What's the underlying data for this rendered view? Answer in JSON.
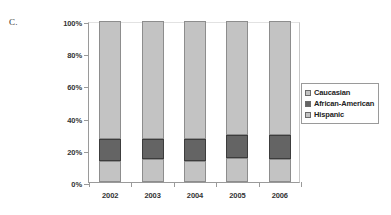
{
  "panel": {
    "letter": "C."
  },
  "legend": {
    "position": "right",
    "entries": [
      {
        "label": "Caucasian",
        "color": "#c3c3c3"
      },
      {
        "label": "African-American",
        "color": "#646464"
      },
      {
        "label": "Hispanic",
        "color": "#c3c3c3"
      }
    ]
  },
  "axes": {
    "y_ticks": [
      "0%",
      "20%",
      "40%",
      "60%",
      "80%",
      "100%"
    ],
    "x_ticks": [
      "2002",
      "2003",
      "2004",
      "2005",
      "2006"
    ]
  },
  "chart_data": {
    "type": "bar",
    "title": "",
    "subtitle": "",
    "xlabel": "",
    "ylabel": "",
    "stacked": true,
    "stack_total": 100,
    "grid": false,
    "legend_position": "right",
    "ylim": [
      0,
      100
    ],
    "ytick_values": [
      0,
      20,
      40,
      60,
      80,
      100
    ],
    "ytick_labels": [
      "0%",
      "20%",
      "40%",
      "60%",
      "80%",
      "100%"
    ],
    "categories": [
      "2002",
      "2003",
      "2004",
      "2005",
      "2006"
    ],
    "series": [
      {
        "name": "Hispanic",
        "color": "#c3c3c3",
        "values": [
          13,
          14,
          13,
          15,
          14
        ]
      },
      {
        "name": "African-American",
        "color": "#646464",
        "values": [
          14,
          13,
          14,
          14,
          15
        ]
      },
      {
        "name": "Caucasian",
        "color": "#c3c3c3",
        "values": [
          73,
          73,
          73,
          71,
          71
        ]
      }
    ],
    "stack_order_bottom_to_top": [
      "Hispanic",
      "African-American",
      "Caucasian"
    ],
    "cumulative_tops": {
      "Hispanic": [
        13,
        14,
        13,
        15,
        14
      ],
      "African-American": [
        27,
        27,
        27,
        29,
        29
      ],
      "Caucasian": [
        100,
        100,
        100,
        100,
        100
      ]
    }
  }
}
